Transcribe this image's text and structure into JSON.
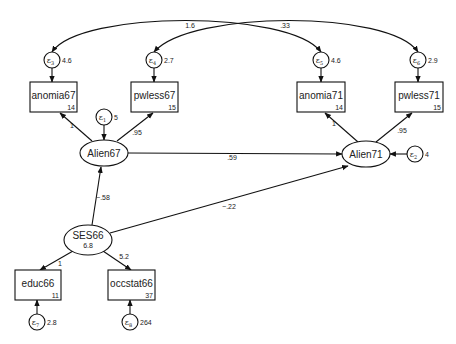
{
  "diagram": {
    "type": "structural-equation-model",
    "observed": [
      {
        "id": "anomia67",
        "label": "anomia67",
        "intercept": "14",
        "x": 30,
        "y": 82,
        "w": 47,
        "h": 30
      },
      {
        "id": "pwless67",
        "label": "pwless67",
        "intercept": "15",
        "x": 131,
        "y": 82,
        "w": 47,
        "h": 30
      },
      {
        "id": "anomia71",
        "label": "anomia71",
        "intercept": "14",
        "x": 297,
        "y": 82,
        "w": 48,
        "h": 30
      },
      {
        "id": "pwless71",
        "label": "pwless71",
        "intercept": "15",
        "x": 395,
        "y": 82,
        "w": 48,
        "h": 30
      },
      {
        "id": "educ66",
        "label": "educ66",
        "intercept": "11",
        "x": 15,
        "y": 270,
        "w": 46,
        "h": 30
      },
      {
        "id": "occstat66",
        "label": "occstat66",
        "intercept": "37",
        "x": 108,
        "y": 270,
        "w": 47,
        "h": 30
      }
    ],
    "latent": [
      {
        "id": "Alien67",
        "label": "Alien67",
        "value": "",
        "cx": 104,
        "cy": 153,
        "rx": 24,
        "ry": 13
      },
      {
        "id": "Alien71",
        "label": "Alien71",
        "value": "",
        "cx": 366,
        "cy": 154,
        "rx": 24,
        "ry": 13
      },
      {
        "id": "SES66",
        "label": "SES66",
        "value": "6.8",
        "cx": 88,
        "cy": 240,
        "rx": 24,
        "ry": 15
      }
    ],
    "errors": [
      {
        "id": "e1",
        "sub": "1",
        "variance": "5",
        "cx": 104,
        "cy": 117
      },
      {
        "id": "e2",
        "sub": "2",
        "variance": "4",
        "cx": 415,
        "cy": 154
      },
      {
        "id": "e3",
        "sub": "3",
        "variance": "4.6",
        "cx": 52,
        "cy": 60
      },
      {
        "id": "e4",
        "sub": "4",
        "variance": "2.7",
        "cx": 154,
        "cy": 60
      },
      {
        "id": "e5",
        "sub": "5",
        "variance": "4.6",
        "cx": 321,
        "cy": 60
      },
      {
        "id": "e6",
        "sub": "6",
        "variance": "2.9",
        "cx": 418,
        "cy": 60
      },
      {
        "id": "e7",
        "sub": "7",
        "variance": "2.8",
        "cx": 37,
        "cy": 322
      },
      {
        "id": "e8",
        "sub": "8",
        "variance": "264",
        "cx": 130,
        "cy": 322
      }
    ],
    "paths": [
      {
        "from": "Alien67",
        "to": "anomia67",
        "coef": "1"
      },
      {
        "from": "Alien67",
        "to": "pwless67",
        "coef": ".95"
      },
      {
        "from": "Alien71",
        "to": "anomia71",
        "coef": "1"
      },
      {
        "from": "Alien71",
        "to": "pwless71",
        "coef": ".95"
      },
      {
        "from": "Alien67",
        "to": "Alien71",
        "coef": ".59"
      },
      {
        "from": "SES66",
        "to": "Alien67",
        "coef": "−.58"
      },
      {
        "from": "SES66",
        "to": "Alien71",
        "coef": "−.22"
      },
      {
        "from": "SES66",
        "to": "educ66",
        "coef": "1"
      },
      {
        "from": "SES66",
        "to": "occstat66",
        "coef": "5.2"
      }
    ],
    "covariances": [
      {
        "between": [
          "e3",
          "e5"
        ],
        "coef": "1.6"
      },
      {
        "between": [
          "e4",
          "e6"
        ],
        "coef": ".33"
      }
    ],
    "error_symbol": "ε"
  }
}
